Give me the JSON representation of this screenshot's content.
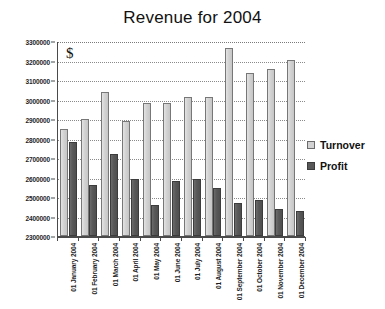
{
  "chart_data": {
    "type": "bar",
    "title": "Revenue for 2004",
    "xlabel": "",
    "ylabel": "",
    "unit_marker": "$",
    "ylim": [
      2300000,
      3300000
    ],
    "ytick_step": 100000,
    "grid": true,
    "legend_position": "right",
    "yticks": [
      "3300000",
      "3200000",
      "3100000",
      "3000000",
      "2900000",
      "2800000",
      "2700000",
      "2600000",
      "2500000",
      "2400000",
      "2300000"
    ],
    "categories": [
      "01 January 2004",
      "01 February 2004",
      "01 March 2004",
      "01 April 2004",
      "01 May 2004",
      "01 June 2004",
      "01 July 2004",
      "01 August 2004",
      "01 September 2004",
      "01 October 2004",
      "01 November 2004",
      "01 December 2004"
    ],
    "series": [
      {
        "name": "Turnover",
        "color": "#d2d2d2",
        "values": [
          2850000,
          2900000,
          3040000,
          2890000,
          2980000,
          2980000,
          3015000,
          3015000,
          3265000,
          3135000,
          3155000,
          3205000
        ]
      },
      {
        "name": "Profit",
        "color": "#585858",
        "values": [
          2780000,
          2560000,
          2720000,
          2590000,
          2460000,
          2580000,
          2590000,
          2545000,
          2470000,
          2485000,
          2440000,
          2430000
        ]
      }
    ]
  }
}
